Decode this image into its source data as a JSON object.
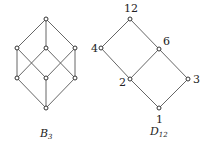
{
  "diagrams": [
    {
      "name": "B3",
      "caption": "B",
      "caption_sub": "3",
      "nodes": [
        {
          "id": "top",
          "label": "",
          "x": 46,
          "y": 19
        },
        {
          "id": "m1",
          "label": "",
          "x": 17,
          "y": 48
        },
        {
          "id": "m2",
          "label": "",
          "x": 46,
          "y": 48
        },
        {
          "id": "m3",
          "label": "",
          "x": 75,
          "y": 48
        },
        {
          "id": "l1",
          "label": "",
          "x": 17,
          "y": 78
        },
        {
          "id": "l2",
          "label": "",
          "x": 46,
          "y": 78
        },
        {
          "id": "l3",
          "label": "",
          "x": 75,
          "y": 78
        },
        {
          "id": "bot",
          "label": "",
          "x": 46,
          "y": 108
        }
      ],
      "edges": [
        [
          "top",
          "m1"
        ],
        [
          "top",
          "m2"
        ],
        [
          "top",
          "m3"
        ],
        [
          "m1",
          "l1"
        ],
        [
          "m1",
          "l2"
        ],
        [
          "m2",
          "l1"
        ],
        [
          "m2",
          "l3"
        ],
        [
          "m3",
          "l2"
        ],
        [
          "m3",
          "l3"
        ],
        [
          "l1",
          "bot"
        ],
        [
          "l2",
          "bot"
        ],
        [
          "l3",
          "bot"
        ]
      ]
    },
    {
      "name": "D12",
      "caption": "D",
      "caption_sub": "12",
      "nodes": [
        {
          "id": "12",
          "label": "12",
          "x": 130,
          "y": 19
        },
        {
          "id": "4",
          "label": "4",
          "x": 101,
          "y": 48
        },
        {
          "id": "6",
          "label": "6",
          "x": 159,
          "y": 49
        },
        {
          "id": "2",
          "label": "2",
          "x": 130,
          "y": 79
        },
        {
          "id": "3",
          "label": "3",
          "x": 188,
          "y": 79
        },
        {
          "id": "1",
          "label": "1",
          "x": 159,
          "y": 108
        }
      ],
      "edges": [
        [
          "12",
          "4"
        ],
        [
          "12",
          "6"
        ],
        [
          "4",
          "2"
        ],
        [
          "6",
          "2"
        ],
        [
          "6",
          "3"
        ],
        [
          "2",
          "1"
        ],
        [
          "3",
          "1"
        ]
      ]
    }
  ]
}
